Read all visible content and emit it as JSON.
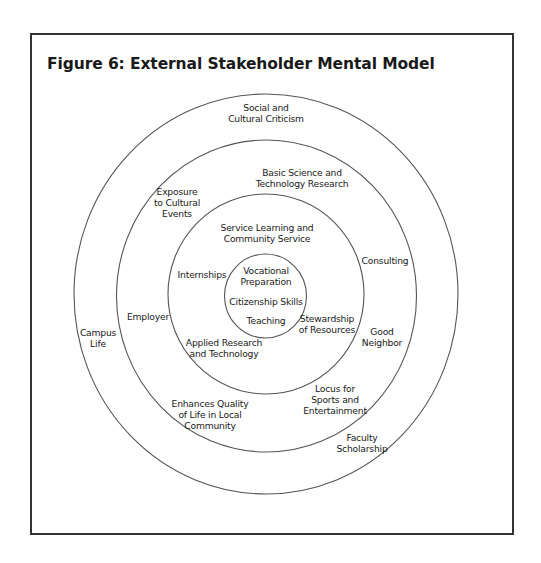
{
  "figure": {
    "title": "Figure 6: External Stakeholder Mental Model"
  },
  "rings": [
    {
      "name": "outer-ring",
      "cx": 266,
      "cy": 294,
      "rx": 192,
      "ry": 200
    },
    {
      "name": "middle-ring",
      "cx": 266.5,
      "cy": 296,
      "rx": 150,
      "ry": 156
    },
    {
      "name": "inner-ring",
      "cx": 266,
      "cy": 294,
      "rx": 98,
      "ry": 100
    },
    {
      "name": "core-ring",
      "cx": 265.5,
      "cy": 296,
      "rx": 41,
      "ry": 42
    }
  ],
  "labels": {
    "outer": [
      {
        "id": "social-cultural-criticism",
        "lines": [
          "Social and",
          "Cultural Criticism"
        ],
        "x": 266,
        "y": 102
      },
      {
        "id": "campus-life",
        "lines": [
          "Campus",
          "Life"
        ],
        "x": 98,
        "y": 327
      },
      {
        "id": "faculty-scholarship",
        "lines": [
          "Faculty",
          "Scholarship"
        ],
        "x": 362,
        "y": 432
      }
    ],
    "middle": [
      {
        "id": "basic-science",
        "lines": [
          "Basic Science and",
          "Technology Research"
        ],
        "x": 302,
        "y": 167
      },
      {
        "id": "exposure-cultural-events",
        "lines": [
          "Exposure",
          "to Cultural",
          "Events"
        ],
        "x": 177,
        "y": 186
      },
      {
        "id": "consulting",
        "lines": [
          "Consulting"
        ],
        "x": 385,
        "y": 255
      },
      {
        "id": "employer",
        "lines": [
          "Employer"
        ],
        "x": 148,
        "y": 311
      },
      {
        "id": "good-neighbor",
        "lines": [
          "Good",
          "Neighbor"
        ],
        "x": 382,
        "y": 326
      },
      {
        "id": "locus-sports-entertainment",
        "lines": [
          "Locus for",
          "Sports and",
          "Entertainment"
        ],
        "x": 335,
        "y": 383
      },
      {
        "id": "enhances-quality-of-life",
        "lines": [
          "Enhances Quality",
          "of Life in Local",
          "Community"
        ],
        "x": 210,
        "y": 398
      }
    ],
    "inner": [
      {
        "id": "service-learning",
        "lines": [
          "Service Learning and",
          "Community Service"
        ],
        "x": 267,
        "y": 222
      },
      {
        "id": "internships",
        "lines": [
          "Internships"
        ],
        "x": 202,
        "y": 269
      },
      {
        "id": "stewardship-of-resources",
        "lines": [
          "Stewardship",
          "of Resources"
        ],
        "x": 327,
        "y": 313
      },
      {
        "id": "applied-research",
        "lines": [
          "Applied Research",
          "and Technology"
        ],
        "x": 224,
        "y": 337
      }
    ],
    "core": [
      {
        "id": "vocational-preparation",
        "lines": [
          "Vocational",
          "Preparation"
        ],
        "x": 266,
        "y": 265
      },
      {
        "id": "citizenship-skills",
        "lines": [
          "Citizenship Skills"
        ],
        "x": 266,
        "y": 296
      },
      {
        "id": "teaching",
        "lines": [
          "Teaching"
        ],
        "x": 266,
        "y": 315
      }
    ]
  },
  "colors": {
    "line": "#555555",
    "frame": "#333333",
    "text": "#1a1a1a"
  }
}
